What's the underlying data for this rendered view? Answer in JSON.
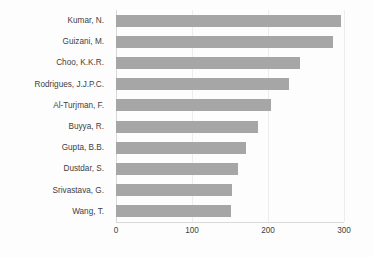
{
  "chart_data": {
    "type": "bar",
    "orientation": "horizontal",
    "title": "",
    "subtitle": "",
    "xlabel": "",
    "ylabel": "",
    "categories": [
      "Kumar, N.",
      "Guizani, M.",
      "Choo, K.K.R.",
      "Rodrigues, J.J.P.C.",
      "Al-Turjman, F.",
      "Buyya, R.",
      "Gupta, B.B.",
      "Dustdar, S.",
      "Srivastava, G.",
      "Wang, T."
    ],
    "values": [
      296,
      285,
      242,
      228,
      204,
      187,
      171,
      160,
      152,
      151
    ],
    "xlim": [
      0,
      300
    ],
    "xticks": [
      0,
      100,
      200,
      300
    ],
    "xtick_labels": [
      "0",
      "100",
      "200",
      "300"
    ],
    "grid": true,
    "grid_axis": "x",
    "legend": false,
    "legend_position": "none",
    "bar_color": "#a6a6a6",
    "gridline_color": "#ededed",
    "axis_color": "#d9d9d9",
    "label_color": "#3f3f3f",
    "background_color": "#fdfdfd"
  }
}
